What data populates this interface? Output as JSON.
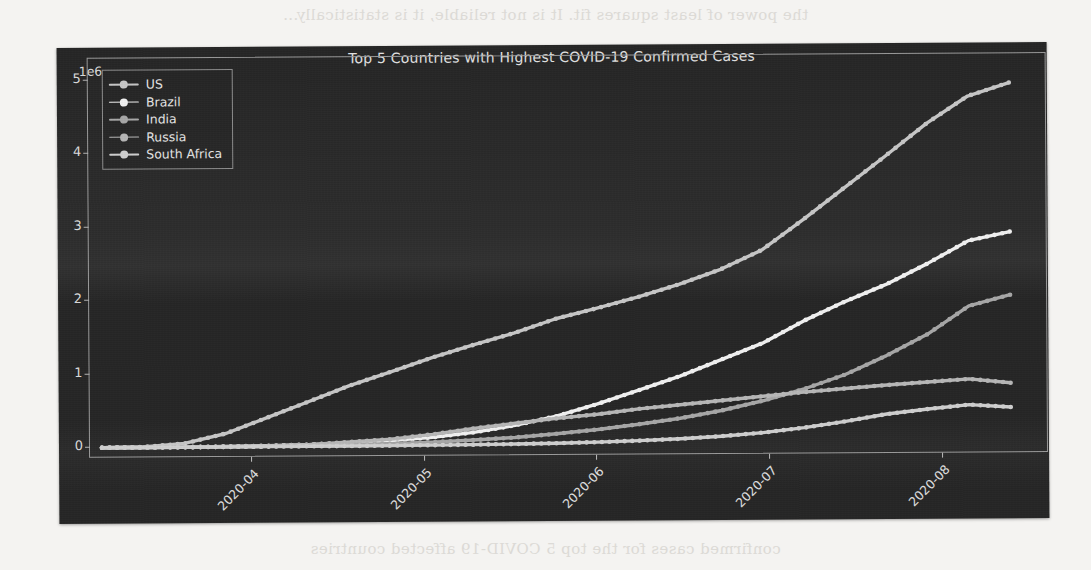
{
  "page": {
    "bleed_text_top": "the power of least squares fit. It is not reliable, it is statistically...",
    "bleed_text_bottom": "confirmed cases for the top 5 COVID-19 affected countries"
  },
  "chart_data": {
    "type": "line",
    "title": "Top 5 Countries with Highest COVID-19 Confirmed Cases",
    "xlabel": "",
    "ylabel": "",
    "y_exponent_label": "1e6",
    "grid": false,
    "legend_position": "upper left",
    "ylim": [
      -150000,
      5300000
    ],
    "yticks": [
      0,
      1000000,
      2000000,
      3000000,
      4000000,
      5000000
    ],
    "ytick_labels": [
      "0",
      "1",
      "2",
      "3",
      "4",
      "5"
    ],
    "xtick_labels": [
      "2020-04",
      "2020-05",
      "2020-06",
      "2020-07",
      "2020-08"
    ],
    "xtick_rotation": -45,
    "x": [
      "2020-03-10",
      "2020-03-17",
      "2020-03-24",
      "2020-03-31",
      "2020-04-07",
      "2020-04-14",
      "2020-04-21",
      "2020-04-28",
      "2020-05-05",
      "2020-05-12",
      "2020-05-19",
      "2020-05-26",
      "2020-06-02",
      "2020-06-09",
      "2020-06-16",
      "2020-06-23",
      "2020-06-30",
      "2020-07-07",
      "2020-07-14",
      "2020-07-21",
      "2020-07-28",
      "2020-08-04",
      "2020-08-10"
    ],
    "series": [
      {
        "name": "US",
        "color": "#c8c8c8",
        "marker": "circle",
        "final_value": 4900000,
        "values": [
          1000,
          6400,
          52000,
          184000,
          396000,
          610000,
          825000,
          1010000,
          1200000,
          1370000,
          1530000,
          1720000,
          1860000,
          2010000,
          2180000,
          2380000,
          2640000,
          3050000,
          3480000,
          3910000,
          4350000,
          4720000,
          4900000
        ]
      },
      {
        "name": "Brazil",
        "color": "#f2f2f2",
        "marker": "circle",
        "final_value": 2870000,
        "values": [
          25,
          234,
          2200,
          5700,
          13700,
          25300,
          43000,
          73000,
          115000,
          178000,
          271000,
          392000,
          555000,
          739000,
          928000,
          1150000,
          1370000,
          1670000,
          1930000,
          2160000,
          2440000,
          2750000,
          2870000
        ]
      },
      {
        "name": "India",
        "color": "#a8a8a8",
        "marker": "circle",
        "final_value": 2010000,
        "values": [
          50,
          142,
          536,
          1390,
          5200,
          11400,
          20000,
          31300,
          49400,
          74300,
          106000,
          152000,
          207000,
          276000,
          354000,
          456000,
          585000,
          742000,
          936000,
          1190000,
          1480000,
          1860000,
          2010000
        ]
      },
      {
        "name": "Russia",
        "color": "#b8b8b8",
        "marker": "circle",
        "final_value": 810000,
        "values": [
          20,
          93,
          495,
          2340,
          7500,
          24500,
          57000,
          93600,
          155000,
          232000,
          299000,
          362000,
          415000,
          485000,
          537000,
          592000,
          647000,
          700000,
          746000,
          789000,
          828000,
          866000,
          810000
        ]
      },
      {
        "name": "South Africa",
        "color": "#d0d0d0",
        "marker": "circle",
        "final_value": 480000,
        "values": [
          13,
          62,
          554,
          1380,
          1750,
          2420,
          3460,
          4990,
          7570,
          11400,
          16400,
          24300,
          35800,
          52000,
          73500,
          106000,
          151000,
          215000,
          298000,
          394000,
          459000,
          516000,
          480000
        ]
      }
    ]
  }
}
